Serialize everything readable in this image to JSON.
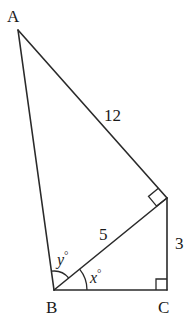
{
  "diagram": {
    "type": "geometry",
    "points": {
      "A": {
        "label": "A",
        "x": 18,
        "y": 30
      },
      "B": {
        "label": "B",
        "x": 54,
        "y": 290
      },
      "C": {
        "label": "C",
        "x": 167,
        "y": 290
      },
      "D": {
        "x": 167,
        "y": 198
      }
    },
    "segments": [
      {
        "from": "A",
        "to": "B"
      },
      {
        "from": "A",
        "to": "D",
        "length_label": "12"
      },
      {
        "from": "B",
        "to": "D",
        "length_label": "5"
      },
      {
        "from": "D",
        "to": "C",
        "length_label": "3"
      },
      {
        "from": "B",
        "to": "C"
      }
    ],
    "labels": {
      "vertex_a": "A",
      "vertex_b": "B",
      "vertex_c": "C",
      "side_ad": "12",
      "side_bd": "5",
      "side_dc": "3",
      "angle_y": "y°",
      "angle_x": "x°",
      "angle_y_var": "y",
      "angle_x_var": "x",
      "degree": "°"
    },
    "right_angles": [
      "D (between AD and BD)",
      "C (between DC and BC)"
    ],
    "angle_marks": [
      {
        "vertex": "B",
        "between": [
          "BA",
          "BD"
        ],
        "label": "y°"
      },
      {
        "vertex": "B",
        "between": [
          "BD",
          "BC"
        ],
        "label": "x°"
      }
    ]
  }
}
